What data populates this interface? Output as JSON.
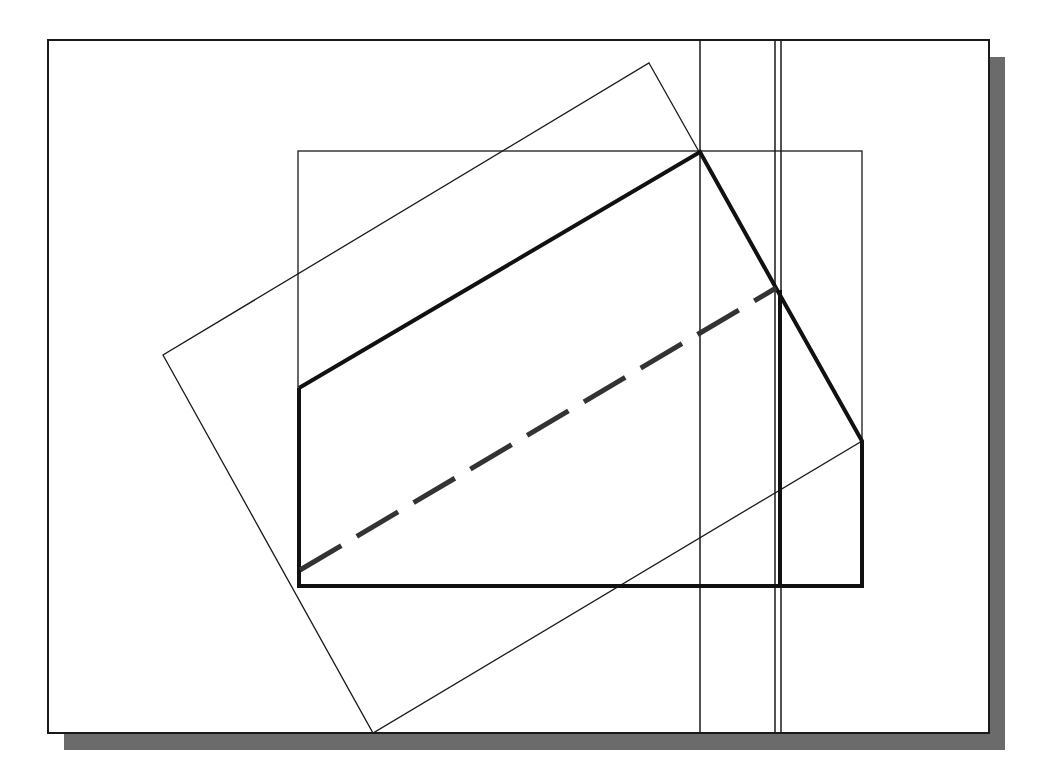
{
  "diagram": {
    "type": "orthographic-projection-construction",
    "frame": {
      "x": 48,
      "y": 40,
      "w": 941,
      "h": 693,
      "stroke": "#1a1a1a"
    },
    "shadow": {
      "dx": 16,
      "dy": 17,
      "color": "#6b6b6b"
    },
    "bounding_rect": {
      "x": 298,
      "y": 151,
      "w": 564,
      "h": 435
    },
    "rotated_rect": {
      "points": [
        [
          649,
          63
        ],
        [
          862,
          441
        ],
        [
          373,
          733
        ],
        [
          163,
          355
        ]
      ]
    },
    "construction_lines_vertical": [
      700,
      775,
      781
    ],
    "object_outline": {
      "points": [
        [
          299,
          388
        ],
        [
          700,
          152
        ],
        [
          776,
          288
        ],
        [
          862,
          441
        ],
        [
          862,
          586
        ],
        [
          299,
          586
        ]
      ],
      "stroke_width": 4,
      "color": "#111111"
    },
    "hidden_edge": {
      "from": [
        300,
        570
      ],
      "to": [
        776,
        288
      ],
      "dash": "48 18",
      "color": "#333333"
    },
    "inner_vertical_edge": {
      "x": 780,
      "y1": 290,
      "y2": 586
    }
  }
}
